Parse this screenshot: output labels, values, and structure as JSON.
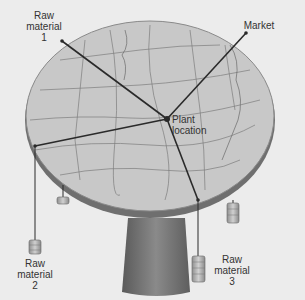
{
  "diagram": {
    "type": "varignon-frame",
    "labels": {
      "raw_material_1": [
        "Raw",
        "material",
        "1"
      ],
      "market": [
        "Market"
      ],
      "plant_location": [
        "Plant",
        "location"
      ],
      "raw_material_2": [
        "Raw",
        "material",
        "2"
      ],
      "raw_material_3": [
        "Raw",
        "material",
        "3"
      ]
    },
    "colors": {
      "background": "#ececec",
      "tabletop": "#c9c9c9",
      "table_edge": "#7a7a7a",
      "pedestal": "#6e6e6e",
      "lines": "#2a2a2a",
      "weights": "#b5b5b5"
    }
  }
}
